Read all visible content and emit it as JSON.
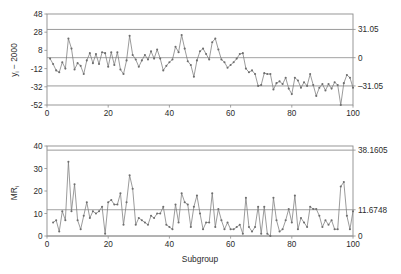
{
  "figure": {
    "type": "control-chart-pair",
    "colors": {
      "series_line": "#7a7a7a",
      "marker": "#6e6e6e",
      "frame": "#8c8c8c",
      "control_limit": "#9a9a9a",
      "center_line": "#8c8c8c",
      "text": "#2b2b2b",
      "background": "#ffffff"
    }
  },
  "chart_data": [
    {
      "type": "line",
      "id": "individuals-chart",
      "title": "",
      "xlabel": "",
      "ylabel": "y_i − 2000",
      "ylabel_main": "y",
      "ylabel_sub": "i",
      "ylabel_rest": " − 2000",
      "xlim": [
        0,
        100
      ],
      "ylim": [
        -52,
        48
      ],
      "xticks": [
        0,
        20,
        40,
        60,
        80,
        100
      ],
      "yticks": [
        -52,
        -32,
        -12,
        8,
        28,
        48
      ],
      "xticklabels": [
        "0",
        "20",
        "40",
        "60",
        "80",
        "100"
      ],
      "yticklabels": [
        "-52",
        "-32",
        "-12",
        "8",
        "28",
        "48"
      ],
      "grid": false,
      "legend": "none",
      "right_labels": [
        {
          "value": 31.05,
          "text": "31.05",
          "kind": "UCL"
        },
        {
          "value": 0,
          "text": "0",
          "kind": "CL"
        },
        {
          "value": -31.05,
          "text": "–31.05",
          "kind": "LCL"
        }
      ],
      "control_limits": {
        "ucl": 31.05,
        "cl": 0,
        "lcl": -31.05
      },
      "x": [
        1,
        2,
        3,
        4,
        5,
        6,
        7,
        8,
        9,
        10,
        11,
        12,
        13,
        14,
        15,
        16,
        17,
        18,
        19,
        20,
        21,
        22,
        23,
        24,
        25,
        26,
        27,
        28,
        29,
        30,
        31,
        32,
        33,
        34,
        35,
        36,
        37,
        38,
        39,
        40,
        41,
        42,
        43,
        44,
        45,
        46,
        47,
        48,
        49,
        50,
        51,
        52,
        53,
        54,
        55,
        56,
        57,
        58,
        59,
        60,
        61,
        62,
        63,
        64,
        65,
        66,
        67,
        68,
        69,
        70,
        71,
        72,
        73,
        74,
        75,
        76,
        77,
        78,
        79,
        80,
        81,
        82,
        83,
        84,
        85,
        86,
        87,
        88,
        89,
        90,
        91,
        92,
        93,
        94,
        95,
        96,
        97,
        98,
        99,
        100
      ],
      "values": [
        -1,
        -7,
        -14,
        -16,
        -5,
        -12,
        21,
        10,
        -13,
        -6,
        -9,
        -18,
        -3,
        5,
        -6,
        4,
        -7,
        6,
        5,
        -10,
        6,
        -8,
        6,
        -13,
        -18,
        -3,
        24,
        3,
        -2,
        -10,
        -3,
        3,
        -2,
        7,
        -1,
        9,
        -1,
        -14,
        -9,
        -5,
        -2,
        12,
        6,
        25,
        10,
        -4,
        -8,
        -21,
        -3,
        7,
        10,
        4,
        -2,
        17,
        21,
        9,
        -2,
        -5,
        -11,
        -8,
        -5,
        -1,
        4,
        5,
        -12,
        -16,
        -14,
        -18,
        -31,
        -30,
        -17,
        -18,
        -18,
        -35,
        -28,
        -26,
        -29,
        -22,
        -34,
        -40,
        -22,
        -25,
        -33,
        -27,
        -31,
        -18,
        -30,
        -42,
        -33,
        -29,
        -36,
        -29,
        -34,
        -27,
        -30,
        -52,
        -28,
        -19,
        -22,
        -33
      ]
    },
    {
      "type": "line",
      "id": "moving-range-chart",
      "title": "",
      "xlabel": "Subgroup",
      "ylabel": "MR_i",
      "ylabel_main": "MR",
      "ylabel_sub": "i",
      "xlim": [
        0,
        100
      ],
      "ylim": [
        0,
        40
      ],
      "xticks": [
        0,
        20,
        40,
        60,
        80,
        100
      ],
      "yticks": [
        0,
        10,
        20,
        30,
        40
      ],
      "xticklabels": [
        "0",
        "20",
        "40",
        "60",
        "80",
        "100"
      ],
      "yticklabels": [
        "0",
        "10",
        "20",
        "30",
        "40"
      ],
      "grid": false,
      "legend": "none",
      "right_labels": [
        {
          "value": 38.1605,
          "text": "38.1605",
          "kind": "UCL"
        },
        {
          "value": 11.6748,
          "text": "11.6748",
          "kind": "CL"
        },
        {
          "value": 0,
          "text": "0",
          "kind": "LCL"
        }
      ],
      "control_limits": {
        "ucl": 38.1605,
        "cl": 11.6748,
        "lcl": 0
      },
      "x": [
        2,
        3,
        4,
        5,
        6,
        7,
        8,
        9,
        10,
        11,
        12,
        13,
        14,
        15,
        16,
        17,
        18,
        19,
        20,
        21,
        22,
        23,
        24,
        25,
        26,
        27,
        28,
        29,
        30,
        31,
        32,
        33,
        34,
        35,
        36,
        37,
        38,
        39,
        40,
        41,
        42,
        43,
        44,
        45,
        46,
        47,
        48,
        49,
        50,
        51,
        52,
        53,
        54,
        55,
        56,
        57,
        58,
        59,
        60,
        61,
        62,
        63,
        64,
        65,
        66,
        67,
        68,
        69,
        70,
        71,
        72,
        73,
        74,
        75,
        76,
        77,
        78,
        79,
        80,
        81,
        82,
        83,
        84,
        85,
        86,
        87,
        88,
        89,
        90,
        91,
        92,
        93,
        94,
        95,
        96,
        97,
        98,
        99,
        100
      ],
      "values": [
        6,
        7,
        2,
        11,
        7,
        33,
        11,
        23,
        7,
        3,
        9,
        15,
        8,
        11,
        10,
        11,
        13,
        1,
        15,
        16,
        14,
        14,
        19,
        5,
        15,
        27,
        21,
        5,
        8,
        7,
        6,
        5,
        9,
        8,
        10,
        10,
        13,
        5,
        4,
        3,
        14,
        6,
        19,
        15,
        14,
        4,
        13,
        18,
        10,
        3,
        6,
        6,
        19,
        4,
        12,
        7,
        3,
        6,
        3,
        3,
        4,
        5,
        1,
        17,
        4,
        2,
        4,
        13,
        1,
        13,
        1,
        0,
        17,
        7,
        2,
        3,
        7,
        12,
        6,
        18,
        3,
        8,
        6,
        4,
        13,
        12,
        12,
        9,
        4,
        7,
        5,
        7,
        3,
        3,
        22,
        24,
        9,
        3,
        11
      ]
    }
  ],
  "labels": {
    "individuals": {
      "y_main": "y",
      "y_sub": "i",
      "y_rest": " − 2000",
      "yticks": [
        "48",
        "28",
        "8",
        "-12",
        "-32",
        "-52"
      ],
      "xticks": [
        "0",
        "20",
        "40",
        "60",
        "80",
        "100"
      ],
      "right": [
        "31.05",
        "0",
        "–31.05"
      ]
    },
    "moving_range": {
      "y_main": "MR",
      "y_sub": "i",
      "yticks": [
        "40",
        "30",
        "20",
        "10",
        "0"
      ],
      "xticks": [
        "0",
        "20",
        "40",
        "60",
        "80",
        "100"
      ],
      "right": [
        "38.1605",
        "11.6748",
        "0"
      ],
      "xlabel": "Subgroup"
    }
  }
}
